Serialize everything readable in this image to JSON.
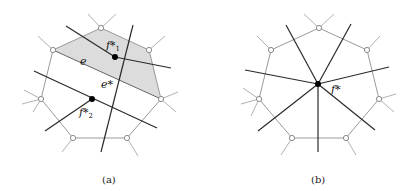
{
  "figure": {
    "panels": [
      {
        "id": "a",
        "caption": "(a)",
        "labels": {
          "f1": "f*",
          "f1_sub": "1",
          "f2": "f*",
          "f2_sub": "2",
          "edge": "e",
          "dual_edge": "e*"
        },
        "description": "Primal heptagonal face structure with edge e separating shaded face f1 from face f2; dual edge e* connects dual vertices f1* and f2*"
      },
      {
        "id": "b",
        "caption": "(b)",
        "labels": {
          "center": "f*"
        },
        "description": "Dual vertex f* at center of heptagonal face with dual edges radiating through each boundary edge"
      }
    ],
    "colors": {
      "primal_edge": "#9a9a9a",
      "dual_edge": "#2a2a2a",
      "shade": "#d9d9d9",
      "vertex_fill": "#ffffff",
      "dual_vertex": "#000000"
    }
  }
}
